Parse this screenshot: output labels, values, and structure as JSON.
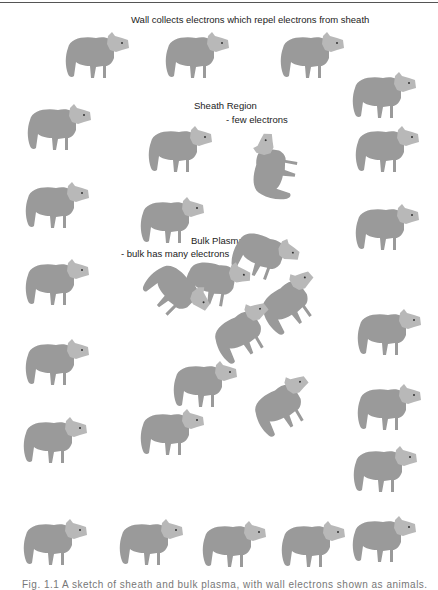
{
  "figure": {
    "top_label": "Wall collects electrons which repel electrons from sheath",
    "sheath_title": "Sheath Region",
    "sheath_note": "- few electrons",
    "bulk_title": "Bulk Plasma",
    "bulk_note": "- bulk has many electrons",
    "caption_partial": "Fig. 1.1 A sketch of sheath and bulk plasma, with wall electrons shown as animals."
  },
  "colors": {
    "body": "#9a9a9a",
    "head": "#b8b8b8",
    "text": "#222222"
  },
  "critters": [
    {
      "id": "wall-1",
      "x": 60,
      "y": 28,
      "rot": 0
    },
    {
      "id": "wall-2",
      "x": 160,
      "y": 28,
      "rot": 0
    },
    {
      "id": "wall-3",
      "x": 275,
      "y": 28,
      "rot": 0
    },
    {
      "id": "right-1",
      "x": 347,
      "y": 68,
      "rot": 0
    },
    {
      "id": "left-1",
      "x": 22,
      "y": 100,
      "rot": 0
    },
    {
      "id": "right-2",
      "x": 350,
      "y": 122,
      "rot": 0
    },
    {
      "id": "sheath-1",
      "x": 143,
      "y": 122,
      "rot": 0
    },
    {
      "id": "sheath-2",
      "x": 238,
      "y": 140,
      "rot": -80
    },
    {
      "id": "left-2",
      "x": 20,
      "y": 178,
      "rot": 0
    },
    {
      "id": "right-3",
      "x": 350,
      "y": 200,
      "rot": 0
    },
    {
      "id": "sheath-3",
      "x": 135,
      "y": 193,
      "rot": 0
    },
    {
      "id": "bulk-1",
      "x": 228,
      "y": 228,
      "rot": 20
    },
    {
      "id": "left-3",
      "x": 20,
      "y": 255,
      "rot": 0
    },
    {
      "id": "bulk-2",
      "x": 180,
      "y": 255,
      "rot": 10
    },
    {
      "id": "bulk-3",
      "x": 140,
      "y": 265,
      "rot": 45
    },
    {
      "id": "bulk-4",
      "x": 255,
      "y": 275,
      "rot": -35
    },
    {
      "id": "bulk-5",
      "x": 208,
      "y": 305,
      "rot": -30
    },
    {
      "id": "right-4",
      "x": 352,
      "y": 305,
      "rot": 0
    },
    {
      "id": "left-4",
      "x": 20,
      "y": 335,
      "rot": 0
    },
    {
      "id": "bulk-6",
      "x": 168,
      "y": 357,
      "rot": 0
    },
    {
      "id": "bulk-7",
      "x": 248,
      "y": 378,
      "rot": -30
    },
    {
      "id": "right-5",
      "x": 352,
      "y": 380,
      "rot": 0
    },
    {
      "id": "bulk-8",
      "x": 135,
      "y": 405,
      "rot": 0
    },
    {
      "id": "left-5",
      "x": 18,
      "y": 413,
      "rot": 0
    },
    {
      "id": "right-6",
      "x": 348,
      "y": 442,
      "rot": 0
    },
    {
      "id": "bottom-1",
      "x": 18,
      "y": 515,
      "rot": 0
    },
    {
      "id": "bottom-2",
      "x": 114,
      "y": 515,
      "rot": 0
    },
    {
      "id": "bottom-3",
      "x": 197,
      "y": 517,
      "rot": 0
    },
    {
      "id": "bottom-4",
      "x": 276,
      "y": 517,
      "rot": 0
    },
    {
      "id": "bottom-5",
      "x": 347,
      "y": 512,
      "rot": 0
    }
  ]
}
